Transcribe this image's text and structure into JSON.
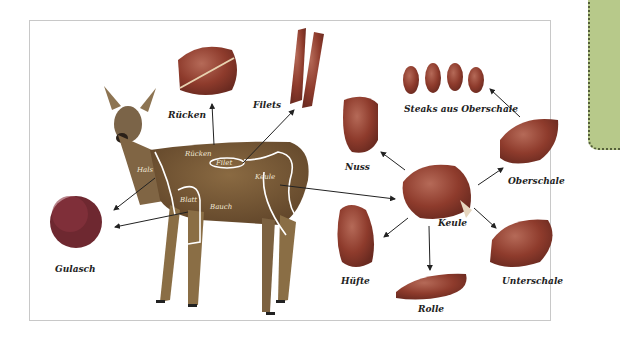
{
  "diagram": {
    "deer_regions": {
      "ruecken": "Rücken",
      "filet": "Filet",
      "hals": "Hals",
      "blatt": "Blatt",
      "bauch": "Bauch",
      "keule": "Keule"
    },
    "cuts": {
      "ruecken": "Rücken",
      "filets": "Filets",
      "gulasch": "Gulasch",
      "nuss": "Nuss",
      "keule": "Keule",
      "steaks": "Steaks aus Oberschale",
      "oberschale": "Oberschale",
      "unterschale": "Unterschale",
      "huefte": "Hüfte",
      "rolle": "Rolle"
    },
    "colors": {
      "meat": "#8a3a2c",
      "meat_light": "#b0574a",
      "deer": "#7a5a35",
      "frame": "#c8c8c8",
      "side_panel": "#b7c98a"
    }
  }
}
